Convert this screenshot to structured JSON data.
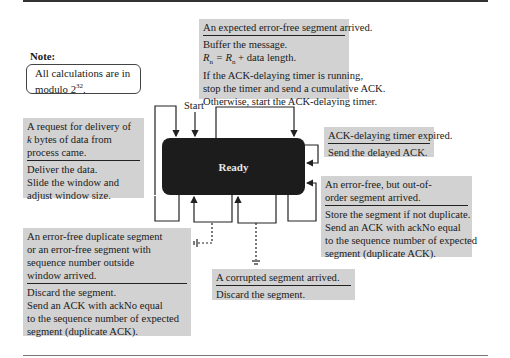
{
  "diagram": {
    "title_state": "Ready",
    "start_label": "Start",
    "note": {
      "title": "Note:",
      "text_line1": "All calculations are in",
      "text_line2_prefix": "modulo 2",
      "text_line2_exp": "32",
      "text_line2_suffix": "."
    },
    "transitions": [
      {
        "id": "expected-segment",
        "event": "An expected error-free segment arrived.",
        "actions": [
          "Buffer the message.",
          "R_n = R_n + data length.",
          "If the ACK-delaying timer is running,",
          "stop the timer and send a cumulative ACK.",
          "Otherwise, start the ACK-delaying timer."
        ]
      },
      {
        "id": "delivery-request",
        "event_lines": [
          "A request for delivery of",
          "k bytes of data from",
          "process came."
        ],
        "actions": [
          "Deliver the data.",
          "Slide the window and",
          "adjust window size."
        ]
      },
      {
        "id": "ack-timer-expired",
        "event": "ACK-delaying timer expired.",
        "actions": [
          "Send the delayed ACK."
        ]
      },
      {
        "id": "out-of-order-segment",
        "event_lines": [
          "An error-free, but out-of-",
          "order segment arrived."
        ],
        "actions": [
          "Store the segment if not duplicate.",
          "Send an ACK with ackNo equal",
          "to the sequence number of expected",
          "segment (duplicate ACK)."
        ]
      },
      {
        "id": "duplicate-segment",
        "event_lines": [
          "An error-free duplicate segment",
          "or an error-free segment with",
          "sequence number outside",
          "window arrived."
        ],
        "actions": [
          "Discard the segment.",
          "Send an ACK with ackNo equal",
          "to the sequence number of expected",
          "segment (duplicate ACK)."
        ]
      },
      {
        "id": "corrupted-segment",
        "event": "A corrupted segment arrived.",
        "actions": [
          "Discard the segment."
        ]
      }
    ],
    "colors": {
      "state_fill": "#1c1c1c",
      "box_fill": "#d2d2d2",
      "line": "#222222"
    }
  },
  "rn_formula": {
    "lhs": "R",
    "lhs_sub": "n",
    "mid": " = R",
    "rhs_sub": "n",
    "tail": " + data length."
  },
  "delivery_k": "k",
  "delivery_rest": " bytes of data from"
}
